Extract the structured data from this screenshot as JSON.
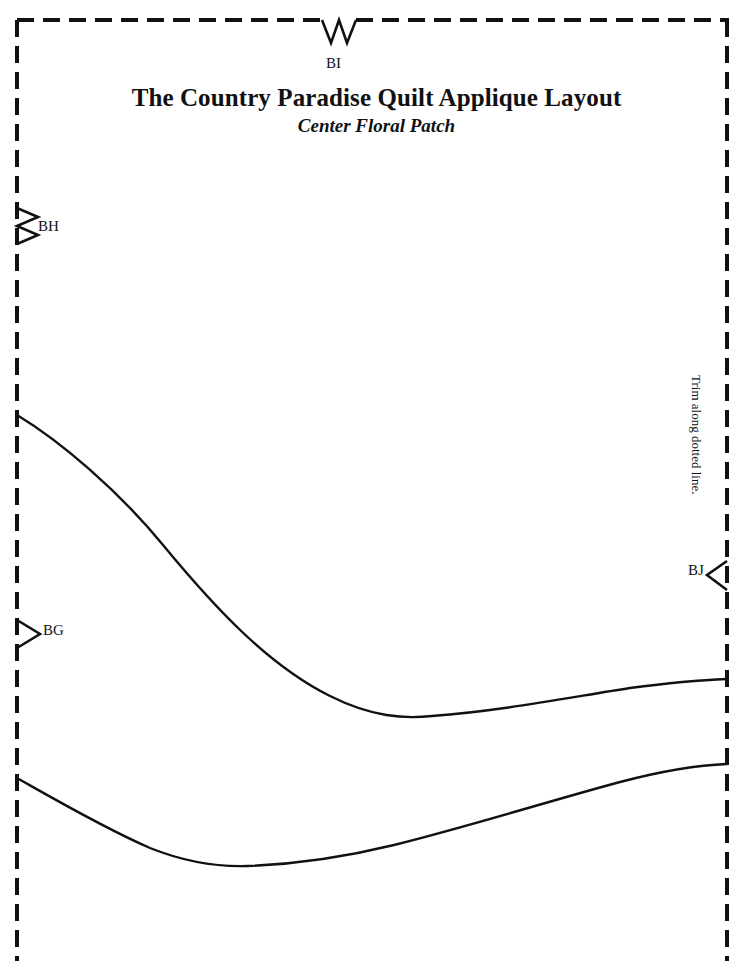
{
  "document": {
    "type": "sewing-pattern-sheet",
    "title": "The Country Paradise Quilt Applique Layout",
    "subtitle": "Center Floral Patch",
    "page_width": 753,
    "page_height": 961,
    "background_color": "#ffffff",
    "ink_color": "#111111"
  },
  "trim_border": {
    "instruction": "Trim along dotted line.",
    "style": "dashed",
    "left_x": 17,
    "right_x": 727,
    "top_y": 20,
    "dash_length": 17,
    "dash_gap": 9,
    "stroke_width": 4
  },
  "notches": [
    {
      "id": "BI",
      "label": "BI",
      "edge": "top",
      "kind": "double-notch",
      "icon": "double-notch-down-icon",
      "position_x": 338,
      "position_y": 20,
      "label_x": 326,
      "label_y": 56
    },
    {
      "id": "BH",
      "label": "BH",
      "edge": "left",
      "kind": "double-notch",
      "icon": "double-notch-right-icon",
      "position_x": 17,
      "position_y": 226,
      "label_x": 38,
      "label_y": 219
    },
    {
      "id": "BG",
      "label": "BG",
      "edge": "left",
      "kind": "single-notch",
      "icon": "single-notch-right-icon",
      "position_x": 17,
      "position_y": 634,
      "label_x": 43,
      "label_y": 623
    },
    {
      "id": "BJ",
      "label": "BJ",
      "edge": "right",
      "kind": "single-notch",
      "icon": "single-notch-left-icon",
      "position_x": 727,
      "position_y": 575,
      "label_x": 688,
      "label_y": 563
    }
  ],
  "cut_lines": [
    {
      "id": "upper-cut-line",
      "name": "upper-seam-curve",
      "start_point": [
        17,
        415
      ],
      "end_point": [
        727,
        679
      ],
      "low_point": [
        432,
        716
      ],
      "path": "M 17 415 C 60 441, 118 490, 163 545 C 215 608, 268 665, 330 696 C 372 717, 404 719, 432 716 C 500 711, 566 698, 630 688 C 668 683, 702 680, 727 679"
    },
    {
      "id": "lower-cut-line",
      "name": "lower-seam-curve",
      "start_point": [
        17,
        778
      ],
      "end_point": [
        727,
        764
      ],
      "low_point": [
        248,
        866
      ],
      "path": "M 17 778 C 56 800, 104 828, 150 848 C 185 862, 218 867, 248 866 C 300 864, 345 857, 394 845 C 470 826, 546 802, 620 782 C 662 771, 700 765, 727 764"
    }
  ]
}
